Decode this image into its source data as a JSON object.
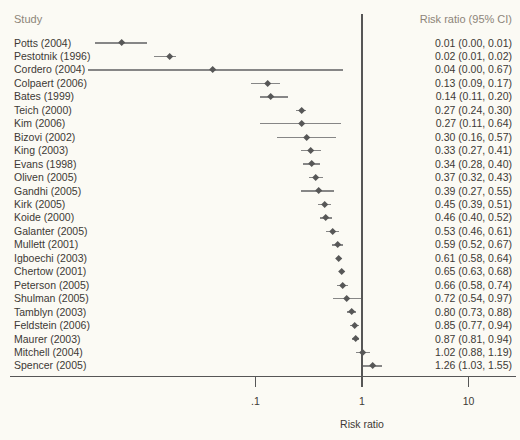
{
  "figure": {
    "headers": {
      "study": "Study",
      "risk_ratio": "Risk ratio (95% CI)"
    }
  },
  "axis": {
    "xlabel": "Risk ratio",
    "tick_labels": [
      ".1",
      "1",
      "10"
    ],
    "tick_values": [
      0.1,
      1,
      10
    ],
    "scale": "log",
    "reference_value": 1
  },
  "colors": {
    "background": "#fbfaf4",
    "text": "#3d3935",
    "header_text": "#8d8579",
    "ci_line": "#868686",
    "marker": "#575757",
    "axis_line": "#565656"
  },
  "chart_data": {
    "type": "forest",
    "columns": [
      "Study",
      "Risk ratio (95% CI)"
    ],
    "xlabel": "Risk ratio",
    "xscale": "log",
    "xticks": [
      0.1,
      1,
      10
    ],
    "reference_line": 1,
    "studies": [
      {
        "label": "Potts (2004)",
        "display": "0.01 (0.00, 0.01)",
        "est": 0.0055,
        "lo": 0.0031,
        "hi": 0.0096
      },
      {
        "label": "Pestotnik (1996)",
        "display": "0.02 (0.01, 0.02)",
        "est": 0.0155,
        "lo": 0.0112,
        "hi": 0.0181
      },
      {
        "label": "Cordero (2004)",
        "display": "0.04 (0.00, 0.67)",
        "est": 0.04,
        "lo": 0.002,
        "hi": 0.67
      },
      {
        "label": "Colpaert (2006)",
        "display": "0.13 (0.09, 0.17)",
        "est": 0.13,
        "lo": 0.09,
        "hi": 0.17
      },
      {
        "label": "Bates (1999)",
        "display": "0.14 (0.11, 0.20)",
        "est": 0.14,
        "lo": 0.11,
        "hi": 0.2
      },
      {
        "label": "Teich (2000)",
        "display": "0.27 (0.24, 0.30)",
        "est": 0.27,
        "lo": 0.24,
        "hi": 0.3
      },
      {
        "label": "Kim (2006)",
        "display": "0.27 (0.11, 0.64)",
        "est": 0.27,
        "lo": 0.11,
        "hi": 0.64
      },
      {
        "label": "Bizovi (2002)",
        "display": "0.30 (0.16, 0.57)",
        "est": 0.3,
        "lo": 0.16,
        "hi": 0.57
      },
      {
        "label": "King (2003)",
        "display": "0.33 (0.27, 0.41)",
        "est": 0.33,
        "lo": 0.27,
        "hi": 0.41
      },
      {
        "label": "Evans (1998)",
        "display": "0.34 (0.28, 0.40)",
        "est": 0.34,
        "lo": 0.28,
        "hi": 0.4
      },
      {
        "label": "Oliven (2005)",
        "display": "0.37 (0.32, 0.43)",
        "est": 0.37,
        "lo": 0.32,
        "hi": 0.43
      },
      {
        "label": "Gandhi (2005)",
        "display": "0.39 (0.27, 0.55)",
        "est": 0.39,
        "lo": 0.27,
        "hi": 0.55
      },
      {
        "label": "Kirk (2005)",
        "display": "0.45 (0.39, 0.51)",
        "est": 0.45,
        "lo": 0.39,
        "hi": 0.51
      },
      {
        "label": "Koide (2000)",
        "display": "0.46 (0.40, 0.52)",
        "est": 0.46,
        "lo": 0.4,
        "hi": 0.52
      },
      {
        "label": "Galanter (2005)",
        "display": "0.53 (0.46, 0.61)",
        "est": 0.53,
        "lo": 0.46,
        "hi": 0.61
      },
      {
        "label": "Mullett (2001)",
        "display": "0.59 (0.52, 0.67)",
        "est": 0.59,
        "lo": 0.52,
        "hi": 0.67
      },
      {
        "label": "Igboechi (2003)",
        "display": "0.61 (0.58, 0.64)",
        "est": 0.61,
        "lo": 0.58,
        "hi": 0.64
      },
      {
        "label": "Chertow (2001)",
        "display": "0.65 (0.63, 0.68)",
        "est": 0.65,
        "lo": 0.63,
        "hi": 0.68
      },
      {
        "label": "Peterson (2005)",
        "display": "0.66 (0.58, 0.74)",
        "est": 0.66,
        "lo": 0.58,
        "hi": 0.74
      },
      {
        "label": "Shulman (2005)",
        "display": "0.72 (0.54, 0.97)",
        "est": 0.72,
        "lo": 0.54,
        "hi": 0.97
      },
      {
        "label": "Tamblyn (2003)",
        "display": "0.80 (0.73, 0.88)",
        "est": 0.8,
        "lo": 0.73,
        "hi": 0.88
      },
      {
        "label": "Feldstein (2006)",
        "display": "0.85 (0.77, 0.94)",
        "est": 0.85,
        "lo": 0.77,
        "hi": 0.94
      },
      {
        "label": "Maurer (2003)",
        "display": "0.87 (0.81, 0.94)",
        "est": 0.87,
        "lo": 0.81,
        "hi": 0.94
      },
      {
        "label": "Mitchell (2004)",
        "display": "1.02 (0.88, 1.19)",
        "est": 1.02,
        "lo": 0.88,
        "hi": 1.19
      },
      {
        "label": "Spencer (2005)",
        "display": "1.26 (1.03, 1.55)",
        "est": 1.26,
        "lo": 1.03,
        "hi": 1.55
      }
    ]
  }
}
